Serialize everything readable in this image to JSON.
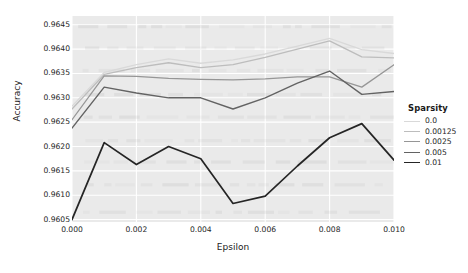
{
  "chart_data": {
    "type": "line",
    "title": "",
    "xlabel": "Epsilon",
    "ylabel": "Accuracy",
    "xlim": [
      0.0,
      0.01
    ],
    "ylim": [
      0.96045,
      0.96468
    ],
    "grid": true,
    "legend_position": "right",
    "legend_title": "Sparsity",
    "xticks": [
      "0.000",
      "0.002",
      "0.004",
      "0.006",
      "0.008",
      "0.010"
    ],
    "xtick_values": [
      0.0,
      0.002,
      0.004,
      0.006,
      0.008,
      0.01
    ],
    "yticks": [
      "0.9605",
      "0.9610",
      "0.9615",
      "0.9620",
      "0.9625",
      "0.9630",
      "0.9635",
      "0.9640",
      "0.9645"
    ],
    "ytick_values": [
      0.9605,
      0.961,
      0.9615,
      0.962,
      0.9625,
      0.963,
      0.9635,
      0.964,
      0.9645
    ],
    "x": [
      0.0,
      0.001,
      0.002,
      0.003,
      0.004,
      0.005,
      0.006,
      0.007,
      0.008,
      0.009,
      0.01
    ],
    "series": [
      {
        "name": "0.0",
        "color": "#d9d9d9",
        "width": 1.3,
        "values": [
          0.96283,
          0.96352,
          0.96368,
          0.9638,
          0.96371,
          0.96378,
          0.9639,
          0.96406,
          0.96422,
          0.96399,
          0.96391
        ]
      },
      {
        "name": "0.00125",
        "color": "#bdbdbd",
        "width": 1.3,
        "values": [
          0.96277,
          0.96348,
          0.96362,
          0.96372,
          0.96362,
          0.96368,
          0.96383,
          0.964,
          0.96417,
          0.96384,
          0.96382
        ]
      },
      {
        "name": "0.0025",
        "color": "#969696",
        "width": 1.3,
        "values": [
          0.96255,
          0.96345,
          0.96344,
          0.9634,
          0.96338,
          0.96337,
          0.96339,
          0.96343,
          0.96343,
          0.96322,
          0.96368
        ]
      },
      {
        "name": "0.005",
        "color": "#636363",
        "width": 1.4,
        "values": [
          0.96238,
          0.96322,
          0.9631,
          0.963,
          0.963,
          0.96277,
          0.963,
          0.9633,
          0.96355,
          0.96307,
          0.96313
        ]
      },
      {
        "name": "0.01",
        "color": "#252525",
        "width": 1.7,
        "values": [
          0.9605,
          0.96208,
          0.96163,
          0.962,
          0.96175,
          0.96083,
          0.96098,
          0.9616,
          0.96218,
          0.96247,
          0.96172
        ]
      }
    ]
  },
  "axes": {
    "plot_background": "#eaeaea",
    "grid_color": "#ffffff",
    "figure_background": "#ffffff"
  }
}
